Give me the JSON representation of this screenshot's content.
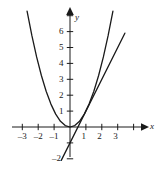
{
  "chart_data": {
    "type": "line",
    "title": "",
    "xlabel": "x",
    "ylabel": "y",
    "xlim": [
      -3.8,
      4.3
    ],
    "ylim": [
      -2.4,
      7.4
    ],
    "grid": false,
    "legend": null,
    "xticks": [
      -3,
      -2,
      -1,
      1,
      2,
      3
    ],
    "xtick_labels": [
      "–3",
      "–2",
      "–1",
      "1",
      "2",
      "3"
    ],
    "yticks": [
      -2,
      1,
      2,
      3,
      4,
      5,
      6
    ],
    "ytick_labels": [
      "–2",
      "1",
      "2",
      "3",
      "4",
      "5",
      "6"
    ],
    "series": [
      {
        "name": "parabola",
        "equation": "y = x^2",
        "type": "curve",
        "x_start": -2.7,
        "x_end": 2.7,
        "points": [
          {
            "x": -2.7,
            "y": 7.29
          },
          {
            "x": -2.4,
            "y": 5.76
          },
          {
            "x": -2.1,
            "y": 4.41
          },
          {
            "x": -1.8,
            "y": 3.24
          },
          {
            "x": -1.5,
            "y": 2.25
          },
          {
            "x": -1.2,
            "y": 1.44
          },
          {
            "x": -0.9,
            "y": 0.81
          },
          {
            "x": -0.6,
            "y": 0.36
          },
          {
            "x": -0.3,
            "y": 0.09
          },
          {
            "x": 0.0,
            "y": 0.0
          },
          {
            "x": 0.3,
            "y": 0.09
          },
          {
            "x": 0.6,
            "y": 0.36
          },
          {
            "x": 0.9,
            "y": 0.81
          },
          {
            "x": 1.2,
            "y": 1.44
          },
          {
            "x": 1.5,
            "y": 2.25
          },
          {
            "x": 1.8,
            "y": 3.24
          },
          {
            "x": 2.1,
            "y": 4.41
          },
          {
            "x": 2.4,
            "y": 5.76
          },
          {
            "x": 2.7,
            "y": 7.29
          }
        ]
      },
      {
        "name": "tangent-line",
        "equation": "y = 2x - 1",
        "type": "line",
        "points": [
          {
            "x": -0.55,
            "y": -2.1
          },
          {
            "x": 3.45,
            "y": 5.9
          }
        ]
      }
    ],
    "annotations": [],
    "colors": {
      "axis": "#1a1a1a",
      "curve": "#1a1a1a",
      "line": "#1a1a1a",
      "background": "#ffffff"
    }
  },
  "axis_labels": {
    "x": "x",
    "y": "y"
  }
}
